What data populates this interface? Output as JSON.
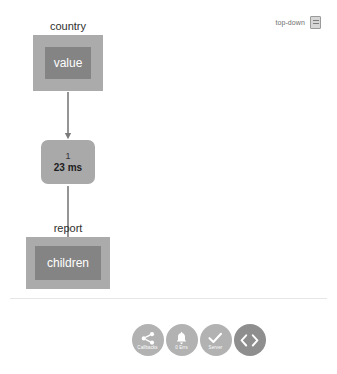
{
  "view_mode": {
    "label": "top-down",
    "icon": "panel-layout-icon"
  },
  "graph": {
    "nodes": [
      {
        "id": "country",
        "caption": "country",
        "inner_label": "value",
        "type": "frame"
      },
      {
        "id": "timing",
        "line_1": "1",
        "line_2": "23 ms",
        "type": "pill"
      },
      {
        "id": "report",
        "caption": "report",
        "inner_label": "children",
        "type": "frame"
      }
    ],
    "edges": [
      {
        "from": "country",
        "to": "timing"
      },
      {
        "from": "timing",
        "to": "report"
      }
    ]
  },
  "toolbar": {
    "buttons": [
      {
        "id": "callbacks",
        "label": "Callbacks",
        "icon": "share-icon",
        "style": "light"
      },
      {
        "id": "errors",
        "label": "0 Errs",
        "icon": "bell-icon",
        "style": "light"
      },
      {
        "id": "server",
        "label": "Server",
        "icon": "check-icon",
        "style": "light"
      },
      {
        "id": "code",
        "label": "",
        "icon": "code-brackets-icon",
        "style": "dark"
      }
    ]
  },
  "colors": {
    "frame_outer": "#ababab",
    "frame_inner": "#848484",
    "pill": "#a9a9a9",
    "edge": "#7a7a7a",
    "fab_light": "#b2b2b2",
    "fab_dark": "#8e8e8e",
    "background": "#ffffff"
  }
}
